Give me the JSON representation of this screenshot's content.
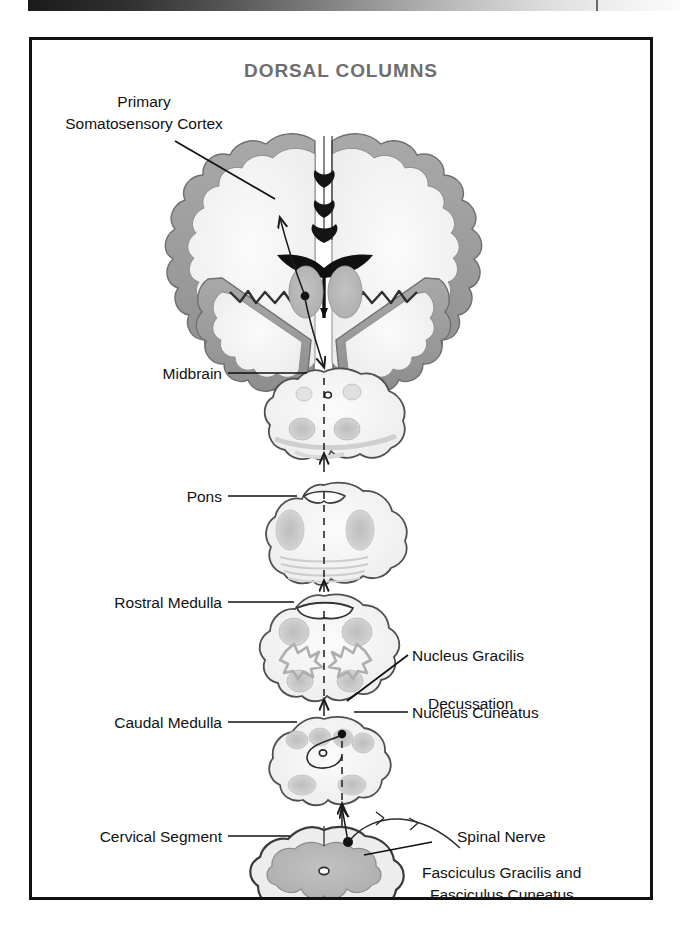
{
  "page": {
    "background": "#ffffff",
    "scan_bar": {
      "name": "scan-gradient-bar",
      "from_color": "#1a1a1a",
      "to_color": "#fbfbfb"
    }
  },
  "figure": {
    "title": "DORSAL COLUMNS",
    "title_color": "#6e6e6e",
    "border_color": "#111111",
    "labels": {
      "primary_somatosensory_cortex_line1": "Primary",
      "primary_somatosensory_cortex_line2": "Somatosensory Cortex",
      "midbrain": "Midbrain",
      "pons": "Pons",
      "rostral_medulla": "Rostral Medulla",
      "caudal_medulla": "Caudal Medulla",
      "cervical_segment": "Cervical Segment",
      "nucleus_gracilis": "Nucleus Gracilis",
      "decussation": "Decussation",
      "nucleus_cuneatus": "Nucleus Cuneatus",
      "spinal_nerve": "Spinal Nerve",
      "fasciculus_line1": "Fasciculus Gracilis and",
      "fasciculus_line2": "Fasciculus Cuneatus"
    },
    "sections": [
      {
        "name": "cerebral-cortex-coronal-section",
        "label": "Primary Somatosensory Cortex",
        "side": "left",
        "level": 1
      },
      {
        "name": "midbrain-section",
        "label": "Midbrain",
        "side": "left",
        "level": 2
      },
      {
        "name": "pons-section",
        "label": "Pons",
        "side": "left",
        "level": 3
      },
      {
        "name": "rostral-medulla-section",
        "label": "Rostral Medulla",
        "side": "left",
        "level": 4
      },
      {
        "name": "caudal-medulla-section",
        "label": "Caudal Medulla",
        "side": "left",
        "level": 5
      },
      {
        "name": "cervical-spinal-cord-section",
        "label": "Cervical Segment",
        "side": "left",
        "level": 6
      }
    ],
    "right_annotations": [
      {
        "name": "nucleus-gracilis",
        "label": "Nucleus Gracilis",
        "has_leader": true
      },
      {
        "name": "decussation",
        "label": "Decussation",
        "has_leader": false
      },
      {
        "name": "nucleus-cuneatus",
        "label": "Nucleus Cuneatus",
        "has_leader": true
      },
      {
        "name": "spinal-nerve",
        "label": "Spinal Nerve",
        "has_leader": true
      },
      {
        "name": "fasciculus-gracilis-and-cuneatus",
        "label": "Fasciculus Gracilis and Fasciculus Cuneatus",
        "has_leader": true
      }
    ]
  }
}
